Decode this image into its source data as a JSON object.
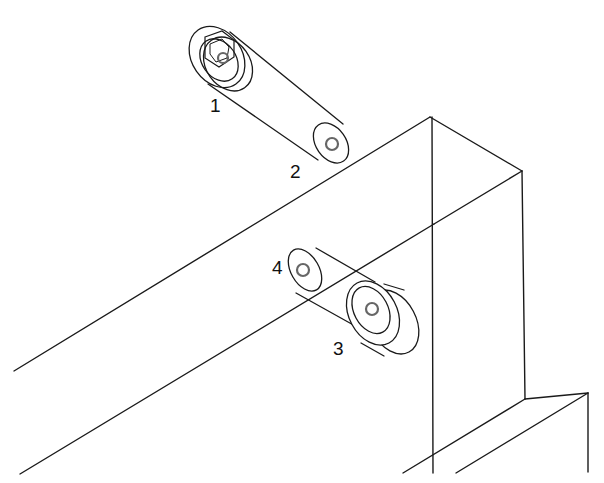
{
  "diagram": {
    "type": "isometric-assembly-drawing",
    "stroke_color": "#1a1a1a",
    "inner_circle_color": "#666666",
    "background": "#ffffff",
    "callouts": [
      {
        "id": "1",
        "text": "1",
        "x": 210,
        "y": 96
      },
      {
        "id": "2",
        "text": "2",
        "x": 290,
        "y": 162
      },
      {
        "id": "3",
        "text": "3",
        "x": 333,
        "y": 339
      },
      {
        "id": "4",
        "text": "4",
        "x": 272,
        "y": 258
      }
    ],
    "structure_lines": [
      [
        430,
        117,
        14,
        371
      ],
      [
        430,
        117,
        522,
        171
      ],
      [
        432,
        117,
        433,
        473
      ],
      [
        522,
        171,
        434,
        224
      ],
      [
        522,
        171,
        525,
        399
      ],
      [
        434,
        224,
        20,
        474
      ],
      [
        525,
        399,
        588,
        393
      ],
      [
        525,
        399,
        403,
        473
      ],
      [
        588,
        393,
        588,
        472
      ],
      [
        588,
        393,
        456,
        473
      ]
    ],
    "parts": {
      "part1_washer_outer": {
        "cx": 217,
        "cy": 57,
        "rx": 25,
        "ry": 33,
        "rot": 35
      },
      "part1_washer_back": {
        "cx": 228,
        "cy": 64,
        "rx": 22,
        "ry": 29,
        "rot": 35
      },
      "part1_washer_inner": {
        "cx": 219,
        "cy": 60,
        "rx": 17,
        "ry": 23,
        "rot": 35
      },
      "part1_hex_points": "205,37 222,31 234,40 234,57 219,67 205,58",
      "part1_hex_inner": "210,44 222,39 229,47 227,58 216,62 210,54",
      "part1_hole": {
        "cx": 223,
        "cy": 58,
        "r": 5
      },
      "part2_cyl_top": [
        230,
        32,
        343,
        124
      ],
      "part2_cyl_bottom": [
        208,
        84,
        318,
        160
      ],
      "part2_end": {
        "cx": 331,
        "cy": 143,
        "rx": 15,
        "ry": 22,
        "rot": 35
      },
      "part2_hole": {
        "cx": 332,
        "cy": 144,
        "r": 6
      },
      "part4_end": {
        "cx": 305,
        "cy": 270,
        "rx": 14,
        "ry": 23,
        "rot": 30
      },
      "part4_hole": {
        "cx": 303,
        "cy": 270,
        "r": 6
      },
      "part4_cyl_top": [
        316,
        248,
        375,
        282
      ],
      "part4_cyl_bottom": [
        296,
        293,
        357,
        327
      ],
      "part3_front_outer": {
        "cx": 373,
        "cy": 313,
        "rx": 24,
        "ry": 34,
        "rot": 28
      },
      "part3_front_inner": {
        "cx": 371,
        "cy": 310,
        "rx": 17,
        "ry": 25,
        "rot": 28
      },
      "part3_back": {
        "cx": 393,
        "cy": 322,
        "rx": 23,
        "ry": 34,
        "rot": 28
      },
      "part3_hole": {
        "cx": 372,
        "cy": 309,
        "r": 6
      },
      "part3_side_top": [
        384,
        284,
        404,
        290
      ],
      "part3_side_bottom": [
        361,
        343,
        384,
        356
      ]
    }
  }
}
